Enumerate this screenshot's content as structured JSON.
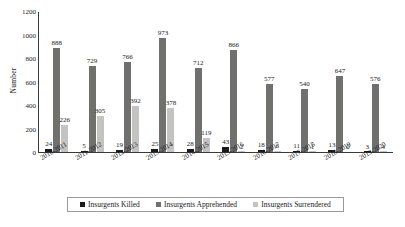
{
  "chart_data": {
    "type": "bar",
    "title": "",
    "subtitle": "",
    "xlabel": "",
    "ylabel": "Number",
    "ylim": [
      0,
      1200
    ],
    "ytick_labels": [
      "1200",
      "1000",
      "800",
      "600",
      "400",
      "200",
      "0"
    ],
    "ytick_values": [
      1200,
      1000,
      800,
      600,
      400,
      200,
      0
    ],
    "grid": false,
    "legend_position": "bottom",
    "categories": [
      "2010-2011",
      "2011-2012",
      "2012-2013",
      "2013-2014",
      "2014-2015",
      "2015-2016",
      "2016-2017",
      "2017-2018",
      "2018-2019",
      "2019-2020"
    ],
    "series": [
      {
        "name": "Insurgents Killed",
        "color": "#1a1a1a",
        "values": [
          24,
          5,
          19,
          25,
          28,
          43,
          18,
          11,
          13,
          3
        ]
      },
      {
        "name": "Insurgents Apprehended",
        "color": "#70706f",
        "values": [
          888,
          729,
          766,
          973,
          712,
          866,
          577,
          540,
          647,
          576
        ]
      },
      {
        "name": "Insurgents Surrendered",
        "color": "#c3c3c2",
        "values": [
          226,
          305,
          392,
          378,
          119,
          2,
          6,
          1,
          0,
          4
        ]
      }
    ]
  },
  "legend": {
    "items": [
      {
        "label": "Insurgents Killed",
        "color": "#1a1a1a"
      },
      {
        "label": "Insurgents Apprehended",
        "color": "#70706f"
      },
      {
        "label": "Insurgents Surrendered",
        "color": "#c3c3c2"
      }
    ]
  },
  "axis": {
    "y_title": "Number"
  },
  "colors": {
    "axis": "#3a3a3a",
    "text": "#1a1a1a",
    "legend_border": "#9a9a9a",
    "background": "#ffffff"
  }
}
